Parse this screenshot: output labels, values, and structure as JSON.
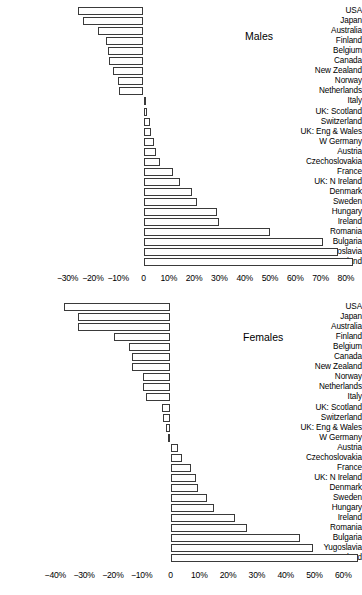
{
  "chart_data": [
    {
      "type": "bar",
      "title": "Males",
      "orientation": "horizontal",
      "xlabel": "",
      "ylabel": "",
      "xlim": [
        -32,
        84
      ],
      "grid": false,
      "legend": false,
      "tick_labels": [
        "−30%",
        "−20%",
        "−10%",
        "0",
        "10%",
        "20%",
        "30%",
        "40%",
        "50%",
        "60%",
        "70%",
        "80%"
      ],
      "tick_values": [
        -30,
        -20,
        -10,
        0,
        10,
        20,
        30,
        40,
        50,
        60,
        70,
        80
      ],
      "categories": [
        "USA",
        "Japan",
        "Australia",
        "Finland",
        "Belgium",
        "Canada",
        "New Zealand",
        "Norway",
        "Netherlands",
        "Italy",
        "UK: Scotland",
        "Switzerland",
        "UK: Eng & Wales",
        "W Germany",
        "Austria",
        "Czechoslovakia",
        "France",
        "UK: N Ireland",
        "Denmark",
        "Sweden",
        "Hungary",
        "Ireland",
        "Romania",
        "Bulgaria",
        "Yugoslavia",
        "Poland"
      ],
      "values": [
        -26,
        -24,
        -18,
        -15,
        -14,
        -13.5,
        -12,
        -10,
        -9.5,
        1,
        1.5,
        2.5,
        3,
        4,
        5,
        6.5,
        11.5,
        14.5,
        19,
        21,
        29,
        30,
        50,
        71,
        77,
        83
      ]
    },
    {
      "type": "bar",
      "title": "Females",
      "orientation": "horizontal",
      "xlabel": "",
      "ylabel": "",
      "xlim": [
        -42,
        66
      ],
      "grid": false,
      "legend": false,
      "tick_labels": [
        "−40%",
        "−30%",
        "−20%",
        "−10%",
        "0",
        "10%",
        "20%",
        "30%",
        "40%",
        "50%",
        "60%"
      ],
      "tick_values": [
        -40,
        -30,
        -20,
        -10,
        0,
        10,
        20,
        30,
        40,
        50,
        60
      ],
      "categories": [
        "USA",
        "Japan",
        "Australia",
        "Finland",
        "Belgium",
        "Canada",
        "New Zealand",
        "Norway",
        "Netherlands",
        "Italy",
        "UK: Scotland",
        "Switzerland",
        "UK: Eng & Wales",
        "W Germany",
        "Austria",
        "Czechoslovakia",
        "France",
        "UK: N Ireland",
        "Denmark",
        "Sweden",
        "Hungary",
        "Ireland",
        "Romania",
        "Bulgaria",
        "Yugoslavia",
        "Poland"
      ],
      "values": [
        -37,
        -32,
        -32,
        -19.5,
        -14.5,
        -13.5,
        -13.5,
        -9.5,
        -9.5,
        -8.5,
        -3,
        -2.5,
        -1.5,
        -1,
        2.5,
        4,
        7,
        9,
        9.5,
        12.5,
        15,
        22.5,
        26.5,
        45,
        49.5,
        65
      ]
    }
  ]
}
